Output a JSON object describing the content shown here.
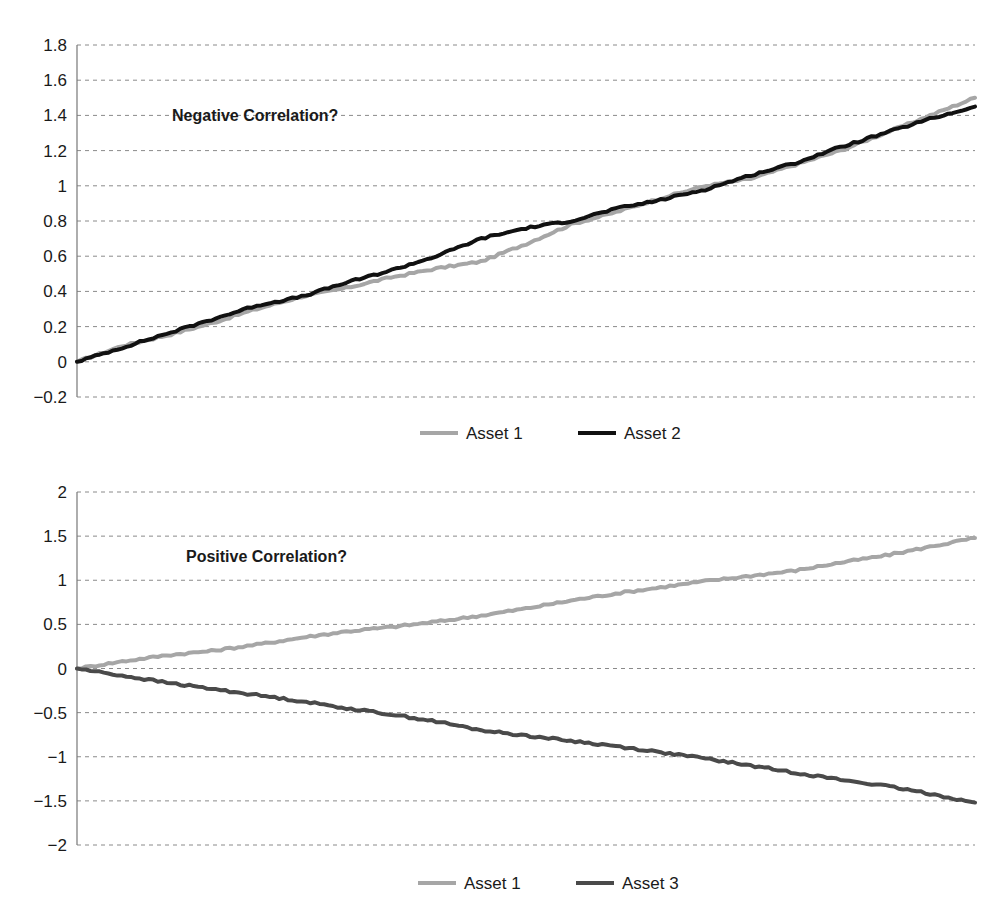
{
  "chart_data": [
    {
      "type": "line",
      "title": "",
      "annotation": "Negative Correlation?",
      "xlabel": "",
      "ylabel": "",
      "ylim": [
        -0.2,
        1.8
      ],
      "yticks": [
        1.8,
        1.6,
        1.4,
        1.2,
        1,
        0.8,
        0.6,
        0.4,
        0.2,
        0,
        -0.2
      ],
      "ytick_labels": [
        "1.8",
        "1.6",
        "1.4",
        "1.2",
        "1",
        "0.8",
        "0.6",
        "0.4",
        "0.2",
        "0",
        "−0.2"
      ],
      "grid": true,
      "legend_position": "bottom",
      "x": [
        0,
        0.05,
        0.1,
        0.15,
        0.2,
        0.25,
        0.3,
        0.35,
        0.4,
        0.45,
        0.5,
        0.55,
        0.6,
        0.65,
        0.7,
        0.75,
        0.8,
        0.85,
        0.9,
        0.95,
        1.0
      ],
      "series": [
        {
          "name": "Asset 1",
          "color": "#a6a6a6",
          "values": [
            0,
            0.09,
            0.15,
            0.22,
            0.3,
            0.37,
            0.42,
            0.48,
            0.53,
            0.57,
            0.67,
            0.78,
            0.85,
            0.93,
            1.0,
            1.04,
            1.12,
            1.2,
            1.3,
            1.4,
            1.5
          ]
        },
        {
          "name": "Asset 2",
          "color": "#111111",
          "values": [
            0,
            0.08,
            0.16,
            0.24,
            0.32,
            0.37,
            0.45,
            0.52,
            0.6,
            0.7,
            0.76,
            0.8,
            0.87,
            0.92,
            0.98,
            1.06,
            1.13,
            1.22,
            1.3,
            1.38,
            1.45
          ]
        }
      ]
    },
    {
      "type": "line",
      "title": "",
      "annotation": "Positive Correlation?",
      "xlabel": "",
      "ylabel": "",
      "ylim": [
        -2,
        2
      ],
      "yticks": [
        2,
        1.5,
        1,
        0.5,
        0,
        -0.5,
        -1,
        -1.5,
        -2
      ],
      "ytick_labels": [
        "2",
        "1.5",
        "1",
        "0.5",
        "0",
        "−0.5",
        "−1",
        "−1.5",
        "−2"
      ],
      "grid": true,
      "legend_position": "bottom",
      "x": [
        0,
        0.05,
        0.1,
        0.15,
        0.2,
        0.25,
        0.3,
        0.35,
        0.4,
        0.45,
        0.5,
        0.55,
        0.6,
        0.65,
        0.7,
        0.75,
        0.8,
        0.85,
        0.9,
        0.95,
        1.0
      ],
      "series": [
        {
          "name": "Asset 1",
          "color": "#a6a6a6",
          "values": [
            0,
            0.08,
            0.15,
            0.2,
            0.27,
            0.35,
            0.42,
            0.47,
            0.53,
            0.6,
            0.68,
            0.77,
            0.85,
            0.92,
            0.99,
            1.05,
            1.11,
            1.2,
            1.28,
            1.38,
            1.48
          ]
        },
        {
          "name": "Asset 3",
          "color": "#4a4a4a",
          "values": [
            0,
            -0.08,
            -0.16,
            -0.23,
            -0.3,
            -0.37,
            -0.45,
            -0.52,
            -0.6,
            -0.7,
            -0.76,
            -0.82,
            -0.88,
            -0.95,
            -1.02,
            -1.1,
            -1.18,
            -1.26,
            -1.33,
            -1.42,
            -1.52
          ]
        }
      ]
    }
  ]
}
